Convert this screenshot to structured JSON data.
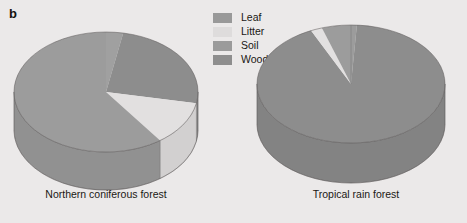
{
  "panel": {
    "letter": "b"
  },
  "legend": {
    "items": [
      {
        "label": "Leaf",
        "color": "#999999"
      },
      {
        "label": "Litter",
        "color": "#dedcdc"
      },
      {
        "label": "Soil",
        "color": "#9b9b9b"
      },
      {
        "label": "Wood",
        "color": "#8e8e8e"
      }
    ]
  },
  "chart_data": [
    {
      "type": "pie",
      "title": "Northern coniferous forest",
      "categories": [
        "Leaf",
        "Litter",
        "Soil",
        "Wood"
      ],
      "values": [
        3,
        12,
        60,
        25
      ],
      "unit": "percent",
      "three_d": true,
      "start_angle_deg": 0,
      "direction": "clockwise",
      "legend_position": "top-center",
      "colors": [
        "#999999",
        "#dedcdc",
        "#9b9b9b",
        "#8e8e8e"
      ]
    },
    {
      "type": "pie",
      "title": "Tropical rain forest",
      "categories": [
        "Leaf",
        "Litter",
        "Soil",
        "Wood"
      ],
      "values": [
        1,
        2,
        5,
        92
      ],
      "unit": "percent",
      "three_d": true,
      "start_angle_deg": 0,
      "direction": "clockwise",
      "legend_position": "top-center",
      "colors": [
        "#999999",
        "#dedcdc",
        "#9b9b9b",
        "#8e8e8e"
      ]
    }
  ],
  "charts": {
    "left": {
      "caption": "Northern coniferous forest"
    },
    "right": {
      "caption": "Tropical rain forest"
    }
  },
  "palette": {
    "background": "#ebe9e9",
    "top_leaf": "#a0a0a0",
    "top_litter": "#e2e0e0",
    "top_soil": "#9c9c9c",
    "top_wood": "#8d8d8d",
    "side_litter": "#d8d6d6",
    "side_soil": "#b4b4b4",
    "side_wood": "#a8a8a8",
    "outline": "#5d5b5b",
    "text": "#1a1814"
  }
}
